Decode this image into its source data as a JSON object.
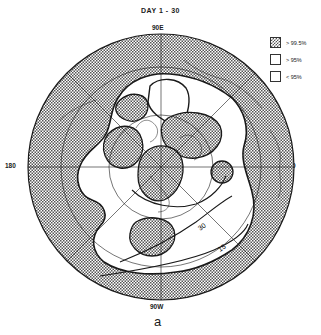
{
  "figure": {
    "title": "DAY  1 - 30",
    "panel_label": "a",
    "projection": "polar stereographic, Northern Hemisphere",
    "longitude_labels": {
      "top": "90E",
      "left": "180",
      "right": "0",
      "bottom": "90W"
    },
    "contour_labels": [
      "30",
      "15"
    ]
  },
  "legend": {
    "items": [
      {
        "label": "> 99.5%",
        "pattern": "crosshatch"
      },
      {
        "label": "> 95%",
        "pattern": "white"
      },
      {
        "label": "< 95%",
        "pattern": "white"
      }
    ]
  },
  "colors": {
    "line": "#1a1a1a",
    "hatch": "#555555",
    "background": "#ffffff"
  }
}
